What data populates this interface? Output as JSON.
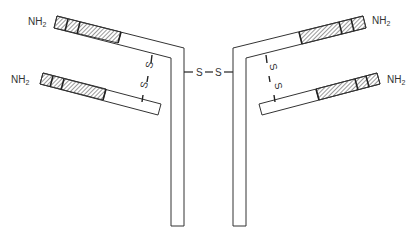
{
  "diagram": {
    "labels": {
      "nh2": "NH",
      "nh2_sub": "2",
      "sulfur": "S"
    },
    "chains": [
      {
        "id": "heavy-left",
        "terminus": "NH2",
        "segments": [
          "variable-1",
          "variable-2",
          "variable-3",
          "constant"
        ]
      },
      {
        "id": "light-left",
        "terminus": "NH2",
        "segments": [
          "variable-1",
          "variable-2",
          "variable-3",
          "constant"
        ]
      },
      {
        "id": "heavy-right",
        "terminus": "NH2",
        "segments": [
          "variable-1",
          "variable-2",
          "variable-3",
          "constant"
        ]
      },
      {
        "id": "light-right",
        "terminus": "NH2",
        "segments": [
          "variable-1",
          "variable-2",
          "variable-3",
          "constant"
        ]
      }
    ],
    "bonds": [
      {
        "id": "interchain-left",
        "between": [
          "light-left",
          "heavy-left"
        ],
        "label": "S–S"
      },
      {
        "id": "interchain-right",
        "between": [
          "light-right",
          "heavy-right"
        ],
        "label": "S–S"
      },
      {
        "id": "hinge",
        "between": [
          "heavy-left",
          "heavy-right"
        ],
        "label": "S–S"
      }
    ],
    "colors": {
      "stroke": "#333333",
      "hatch": "#444444",
      "fill": "#ffffff"
    }
  }
}
